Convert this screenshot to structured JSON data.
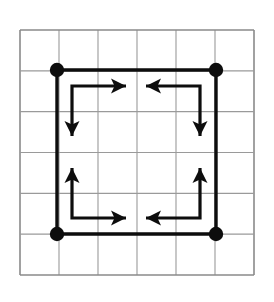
{
  "figure": {
    "background_color": "#ffffff"
  },
  "canvas": {
    "width": 274,
    "height": 302
  },
  "grid": {
    "name": "background-grid",
    "columns": 6,
    "rows": 6,
    "x": 20,
    "y": 30,
    "width": 234,
    "height": 245,
    "cell_width": 39,
    "cell_height": 40.833,
    "line_color": "#9a9a9a",
    "line_width": 1.1,
    "border_color": "#8a8a8a",
    "border_width": 1.6
  },
  "square": {
    "name": "outer-square",
    "stroke_color": "#0d0d0d",
    "stroke_width": 3.4,
    "left": 57,
    "top": 70,
    "right": 216,
    "bottom": 234,
    "corners": [
      {
        "label": "top-left",
        "x": 57,
        "y": 70
      },
      {
        "label": "top-right",
        "x": 216,
        "y": 70
      },
      {
        "label": "bottom-right",
        "x": 216,
        "y": 234
      },
      {
        "label": "bottom-left",
        "x": 57,
        "y": 234
      }
    ]
  },
  "vertex_dots": {
    "name": "vertex-dots",
    "fill_color": "#0d0d0d",
    "radius": 7.2,
    "count": 4,
    "points": [
      {
        "label": "top-left-dot",
        "x": 57,
        "y": 70
      },
      {
        "label": "top-right-dot",
        "x": 216,
        "y": 70
      },
      {
        "label": "bottom-right-dot",
        "x": 216,
        "y": 234
      },
      {
        "label": "bottom-left-dot",
        "x": 57,
        "y": 234
      }
    ]
  },
  "arrow_paths": {
    "name": "inner-circulation-arrows",
    "stroke_color": "#0d0d0d",
    "stroke_width": 3.2,
    "arrowhead_length": 15,
    "arrowhead_half_width": 7.5,
    "arrowhead_notch": 3.5,
    "paths": [
      {
        "label": "top-left-path",
        "direction_sequence": [
          "right",
          "down"
        ],
        "elbow_x": 72,
        "elbow_y": 86,
        "right_arrow_tip_x": 126,
        "down_arrow_tip_y": 136
      },
      {
        "label": "top-right-path",
        "direction_sequence": [
          "left",
          "down"
        ],
        "elbow_x": 200,
        "elbow_y": 86,
        "left_arrow_tip_x": 146,
        "down_arrow_tip_y": 136
      },
      {
        "label": "bottom-left-path",
        "direction_sequence": [
          "right",
          "up"
        ],
        "elbow_x": 72,
        "elbow_y": 218,
        "right_arrow_tip_x": 126,
        "up_arrow_tip_y": 168
      },
      {
        "label": "bottom-right-path",
        "direction_sequence": [
          "left",
          "up"
        ],
        "elbow_x": 200,
        "elbow_y": 218,
        "left_arrow_tip_x": 146,
        "up_arrow_tip_y": 168
      }
    ]
  }
}
